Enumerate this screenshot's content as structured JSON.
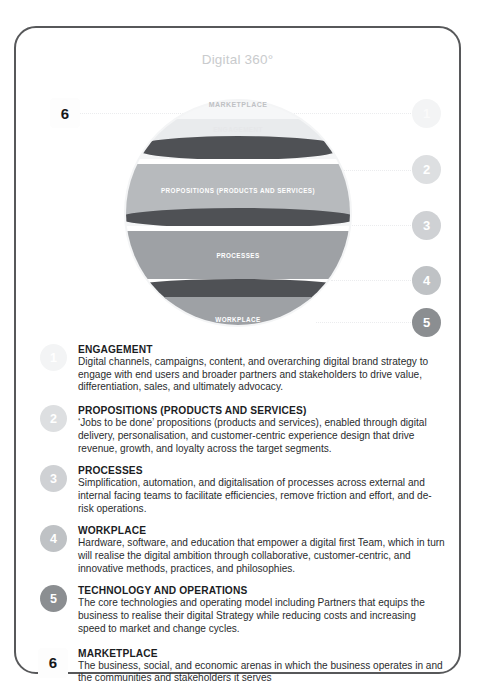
{
  "diagram": {
    "title": "Digital 360°",
    "layers": [
      {
        "id": "marketplace",
        "label": "MARKETPLACE"
      },
      {
        "id": "engagement",
        "label": "ENGAGEMENT"
      },
      {
        "id": "propositions",
        "label": "PROPOSITIONS (PRODUCTS AND SERVICES)"
      },
      {
        "id": "processes",
        "label": "PROCESSES"
      },
      {
        "id": "workplace",
        "label": "WORKPLACE"
      },
      {
        "id": "technology",
        "label": "TECHNOLOGY AND OPERATIONS"
      }
    ],
    "markers": [
      {
        "number": "1"
      },
      {
        "number": "2"
      },
      {
        "number": "3"
      },
      {
        "number": "4"
      },
      {
        "number": "5"
      }
    ],
    "marker_outer": {
      "number": "6"
    }
  },
  "descriptions": [
    {
      "number": "1",
      "title": "ENGAGEMENT",
      "body": "Digital channels, campaigns, content, and overarching digital brand strategy to engage with end users and broader partners and stakeholders to drive value, differentiation, sales, and ultimately advocacy."
    },
    {
      "number": "2",
      "title": "PROPOSITIONS (PRODUCTS AND SERVICES)",
      "body": "‘Jobs to be done’ propositions (products and services), enabled through digital delivery, personalisation, and customer-centric experience design that drive revenue, growth, and loyalty across the target segments."
    },
    {
      "number": "3",
      "title": "PROCESSES",
      "body": "Simplification, automation, and digitalisation of processes across external and internal facing teams to facilitate efficiencies, remove friction and effort, and de-risk operations."
    },
    {
      "number": "4",
      "title": "WORKPLACE",
      "body": "Hardware, software, and education that empower a digital first Team, which in turn will realise the digital ambition through collaborative, customer-centric, and innovative methods, practices, and philosophies."
    },
    {
      "number": "5",
      "title": "TECHNOLOGY AND OPERATIONS",
      "body": "The core technologies and operating model including Partners that equips the business to realise their digital Strategy while reducing costs and increasing speed to market and change cycles."
    },
    {
      "number": "6",
      "title": "MARKETPLACE",
      "body": "The business, social, and economic arenas in which the business operates in and the communities and stakeholders it serves"
    }
  ],
  "colors": {
    "card_border": "#57585a",
    "band_light": "#b7babd",
    "band_engagement": "#eceef0",
    "band_separator": "#4f5155",
    "band_bottom": "#75787c",
    "sphere_halo": "#f4f5f6",
    "title_grey": "#c9cbcd"
  }
}
